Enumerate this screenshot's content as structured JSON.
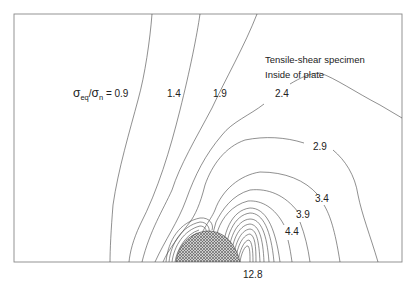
{
  "figure": {
    "title_line1": "Tensile-shear specimen",
    "title_line2": "Inside of plate",
    "quantity_label": {
      "sigma1": "σ",
      "sub1": "eq",
      "slash": "/",
      "sigma2": "σ",
      "sub2": "n",
      "equals": " = "
    },
    "contour_labels": [
      "0.9",
      "1.4",
      "1.9",
      "2.4",
      "2.9",
      "3.4",
      "3.9",
      "4.4",
      "12.8"
    ],
    "hatched_region": "spot-weld nugget (cross-hatched semicircle)",
    "colors": {
      "line": "#444444",
      "frame": "#888888",
      "hatch": "#555555",
      "background": "#ffffff"
    }
  }
}
